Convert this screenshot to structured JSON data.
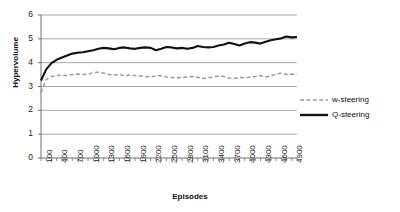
{
  "chart_data": {
    "type": "line",
    "title": "",
    "xlabel": "Episodes",
    "ylabel": "Hypervolume",
    "xlim": [
      100,
      5000
    ],
    "ylim": [
      0,
      6
    ],
    "ytick_labels": [
      "0",
      "1",
      "2",
      "3",
      "4",
      "5",
      "6"
    ],
    "yticks": [
      0,
      1,
      2,
      3,
      4,
      5,
      6
    ],
    "grid": "horizontal",
    "legend_position": "right",
    "xtick_labels": [
      "100",
      "400",
      "700",
      "1000",
      "1300",
      "1600",
      "1900",
      "2200",
      "2500",
      "2800",
      "3100",
      "3400",
      "3700",
      "4000",
      "4300",
      "4600",
      "4900"
    ],
    "xticks": [
      100,
      400,
      700,
      1000,
      1300,
      1600,
      1900,
      2200,
      2500,
      2800,
      3100,
      3400,
      3700,
      4000,
      4300,
      4600,
      4900
    ],
    "x": [
      100,
      200,
      300,
      400,
      500,
      600,
      700,
      800,
      900,
      1000,
      1100,
      1200,
      1300,
      1400,
      1500,
      1600,
      1700,
      1800,
      1900,
      2000,
      2100,
      2200,
      2300,
      2400,
      2500,
      2600,
      2700,
      2800,
      2900,
      3000,
      3100,
      3200,
      3300,
      3400,
      3500,
      3600,
      3700,
      3800,
      3900,
      4000,
      4100,
      4200,
      4300,
      4400,
      4500,
      4600,
      4700,
      4800,
      4900,
      5000
    ],
    "series": [
      {
        "name": "w-steering",
        "style": "dashed",
        "color": "#9a9a9a",
        "values": [
          2.75,
          3.3,
          3.42,
          3.46,
          3.48,
          3.46,
          3.5,
          3.52,
          3.5,
          3.52,
          3.58,
          3.6,
          3.56,
          3.5,
          3.48,
          3.52,
          3.44,
          3.48,
          3.46,
          3.44,
          3.42,
          3.4,
          3.44,
          3.46,
          3.4,
          3.38,
          3.36,
          3.38,
          3.4,
          3.42,
          3.38,
          3.34,
          3.36,
          3.4,
          3.44,
          3.42,
          3.36,
          3.34,
          3.38,
          3.36,
          3.4,
          3.42,
          3.46,
          3.4,
          3.44,
          3.52,
          3.56,
          3.5,
          3.52,
          3.5
        ]
      },
      {
        "name": "Q-steering",
        "style": "solid",
        "color": "#111111",
        "values": [
          3.25,
          3.72,
          3.98,
          4.12,
          4.22,
          4.3,
          4.38,
          4.42,
          4.44,
          4.48,
          4.52,
          4.58,
          4.62,
          4.6,
          4.56,
          4.62,
          4.64,
          4.6,
          4.58,
          4.62,
          4.64,
          4.62,
          4.52,
          4.58,
          4.66,
          4.64,
          4.6,
          4.62,
          4.58,
          4.62,
          4.7,
          4.66,
          4.64,
          4.66,
          4.72,
          4.76,
          4.84,
          4.78,
          4.72,
          4.8,
          4.86,
          4.84,
          4.8,
          4.88,
          4.94,
          4.98,
          5.02,
          5.1,
          5.06,
          5.08
        ]
      }
    ],
    "legend": [
      {
        "label": "w-steering",
        "style": "dashed",
        "color": "#9a9a9a"
      },
      {
        "label": "Q-steering",
        "style": "solid",
        "color": "#111111"
      }
    ],
    "colors": {
      "grid": "#808080",
      "axis": "#6e6e6e",
      "background": "#ffffff"
    }
  }
}
